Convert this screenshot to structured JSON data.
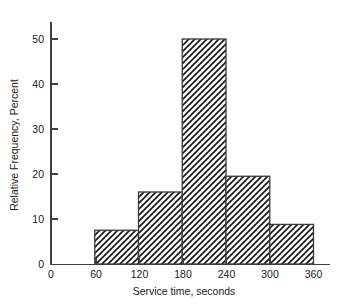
{
  "chart_data": {
    "type": "bar",
    "title": "",
    "subtitle": "",
    "xlabel": "Service time, seconds",
    "ylabel": "Relative Frequency, Percent",
    "xlim": [
      0,
      375
    ],
    "ylim": [
      0,
      56
    ],
    "grid": false,
    "legend": null,
    "xticks": [
      0,
      60,
      120,
      180,
      240,
      300,
      360
    ],
    "xtick_labels": [
      "0",
      "60",
      "120",
      "180",
      "240",
      "300",
      "360"
    ],
    "yticks": [
      0,
      10,
      20,
      30,
      40,
      50
    ],
    "ytick_labels": [
      "0",
      "10",
      "20",
      "30",
      "40",
      "50"
    ],
    "bin_edges": [
      60,
      120,
      180,
      240,
      300,
      360
    ],
    "categories": [
      "60-120",
      "120-180",
      "180-240",
      "240-300",
      "300-360"
    ],
    "values": [
      7.5,
      16.0,
      50.0,
      19.5,
      8.8
    ],
    "bar_fill": "hatch-diagonal-forward",
    "bar_edge_color": "#3a3a3a",
    "bar_hatch_color": "#1a1a1a",
    "background_color": "#ffffff",
    "axis_color": "#404040"
  },
  "axes": {
    "y_title": "Relative Frequency, Percent",
    "x_title": "Service time, seconds"
  },
  "ticks": {
    "y": [
      {
        "label": "50",
        "value": 50
      },
      {
        "label": "40",
        "value": 40
      },
      {
        "label": "30",
        "value": 30
      },
      {
        "label": "20",
        "value": 20
      },
      {
        "label": "10",
        "value": 10
      },
      {
        "label": "0",
        "value": 0
      }
    ],
    "x": [
      {
        "label": "0",
        "value": 0
      },
      {
        "label": "60",
        "value": 60
      },
      {
        "label": "120",
        "value": 120
      },
      {
        "label": "180",
        "value": 180
      },
      {
        "label": "240",
        "value": 240
      },
      {
        "label": "300",
        "value": 300
      },
      {
        "label": "360",
        "value": 360
      }
    ]
  }
}
